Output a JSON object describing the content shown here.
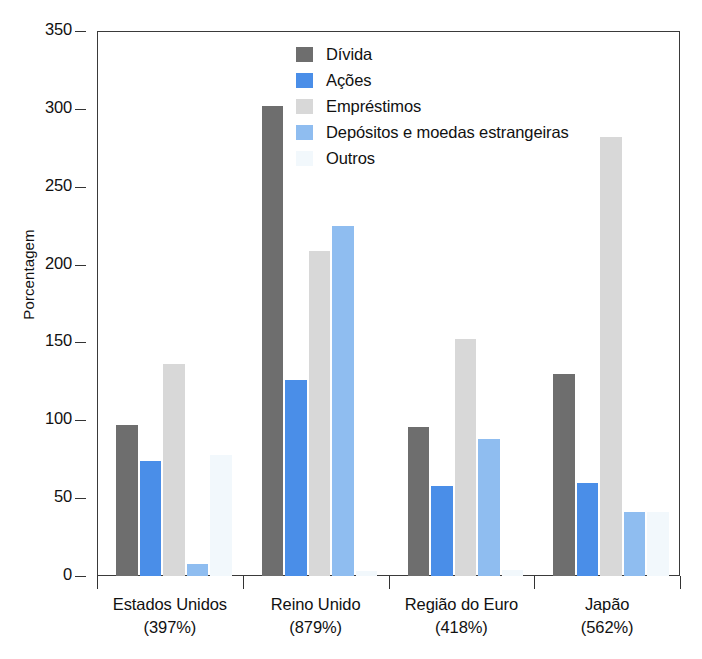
{
  "chart_data": {
    "type": "bar",
    "title": "",
    "subtitle": "",
    "xlabel": "",
    "ylabel": "Porcentagem",
    "ylim": [
      0,
      350
    ],
    "ytick_values": [
      0,
      50,
      100,
      150,
      200,
      250,
      300,
      350
    ],
    "ytick_labels": [
      "0",
      "50",
      "100",
      "150",
      "200",
      "250",
      "300",
      "350"
    ],
    "grid": false,
    "legend_position": "top-center-right",
    "categories": [
      "Estados Unidos",
      "Reino Unido",
      "Região do Euro",
      "Japão"
    ],
    "category_sublabels": [
      "(397%)",
      "(879%)",
      "(418%)",
      "(562%)"
    ],
    "series": [
      {
        "name": "Dívida",
        "color": "#6e6e6e",
        "values": [
          97,
          302,
          96,
          130
        ]
      },
      {
        "name": "Ações",
        "color": "#4a8ee8",
        "values": [
          74,
          126,
          58,
          60
        ]
      },
      {
        "name": "Empréstimos",
        "color": "#d8d8d8",
        "values": [
          136,
          209,
          152,
          282
        ]
      },
      {
        "name": "Depósitos e moedas estrangeiras",
        "color": "#8fbdf0",
        "values": [
          8,
          225,
          88,
          41
        ]
      },
      {
        "name": "Outros",
        "color": "#f2f8fc",
        "values": [
          78,
          3,
          4,
          41
        ]
      }
    ]
  },
  "axis": {
    "y_title": "Porcentagem",
    "ticks": [
      {
        "label": "350",
        "value": 350
      },
      {
        "label": "300",
        "value": 300
      },
      {
        "label": "250",
        "value": 250
      },
      {
        "label": "200",
        "value": 200
      },
      {
        "label": "150",
        "value": 150
      },
      {
        "label": "100",
        "value": 100
      },
      {
        "label": "50",
        "value": 50
      },
      {
        "label": "0",
        "value": 0
      }
    ]
  },
  "groups": [
    {
      "name": "Estados Unidos",
      "pct": "(397%)"
    },
    {
      "name": "Reino Unido",
      "pct": "(879%)"
    },
    {
      "name": "Região do Euro",
      "pct": "(418%)"
    },
    {
      "name": "Japão",
      "pct": "(562%)"
    }
  ],
  "legend": {
    "items": [
      {
        "label": "Dívida",
        "color": "#6e6e6e"
      },
      {
        "label": "Ações",
        "color": "#4a8ee8"
      },
      {
        "label": "Empréstimos",
        "color": "#d8d8d8"
      },
      {
        "label": "Depósitos e moedas estrangeiras",
        "color": "#8fbdf0"
      },
      {
        "label": "Outros",
        "color": "#f2f8fc"
      }
    ]
  }
}
